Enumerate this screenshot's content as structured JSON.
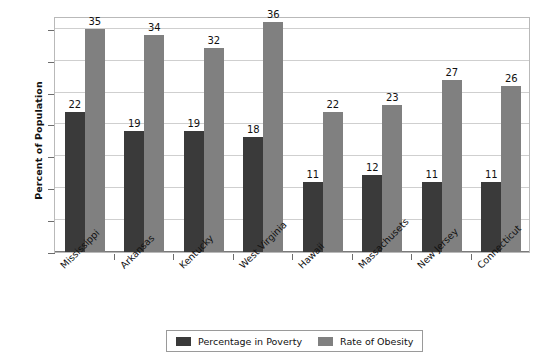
{
  "chart_data": {
    "type": "bar",
    "title": "",
    "xlabel": "",
    "ylabel": "Percent of Population",
    "ylim": [
      0,
      37
    ],
    "yticks": [
      0,
      5,
      10,
      15,
      20,
      25,
      30,
      35
    ],
    "grid": true,
    "legend_position": "bottom",
    "categories": [
      "Mississippi",
      "Arkansas",
      "Kentucky",
      "West Virginia",
      "Hawaii",
      "Massachusets",
      "New Jersey",
      "Connecticut"
    ],
    "series": [
      {
        "name": "Percentage in Poverty",
        "color": "#3a3a3a",
        "values": [
          22,
          19,
          19,
          18,
          11,
          12,
          11,
          11
        ],
        "labels": [
          "22",
          "19",
          "19",
          "18",
          "11",
          "12",
          "11",
          "11"
        ]
      },
      {
        "name": "Rate of Obesity",
        "color": "#808080",
        "values": [
          35,
          34,
          32,
          36,
          22,
          23,
          27,
          26
        ],
        "labels": [
          "35",
          "34",
          "32",
          "36",
          "22",
          "23",
          "27",
          "26"
        ]
      }
    ]
  },
  "legend": {
    "entries": [
      {
        "label": "Percentage in Poverty",
        "swatch": "poverty"
      },
      {
        "label": "Rate of Obesity",
        "swatch": "obesity"
      }
    ]
  }
}
